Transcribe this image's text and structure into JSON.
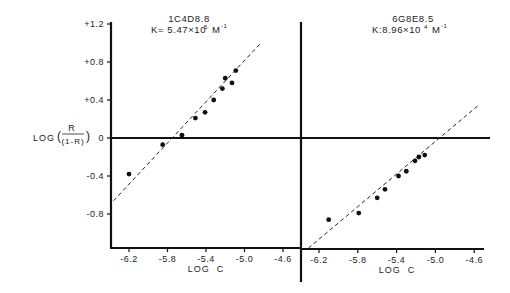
{
  "chart_data": [
    {
      "type": "scatter",
      "title": "1C4D8.8",
      "subtitle": "K= 5.47×10^5 M^-1",
      "k_label": {
        "prefix": "K= 5.47×10",
        "exp": "5",
        "unit": "M",
        "unit_exp": "-1"
      },
      "xlabel": "LOG  C",
      "ylabel": "LOG ( R / (1-R) )",
      "xticks": [
        "-6.2",
        "-5.8",
        "-5.4",
        "-5.0",
        "-4.6"
      ],
      "yticks": [
        "+1.2",
        "+0.8",
        "+0.4",
        "0",
        "-0.4",
        "-0.8"
      ],
      "xlim": [
        -6.4,
        -4.4
      ],
      "ylim": [
        -1.15,
        1.2
      ],
      "grid": false,
      "points": {
        "x": [
          -6.2,
          -5.85,
          -5.65,
          -5.51,
          -5.41,
          -5.32,
          -5.23,
          -5.2,
          -5.13,
          -5.09
        ],
        "y": [
          -0.38,
          -0.07,
          0.03,
          0.21,
          0.27,
          0.4,
          0.52,
          0.63,
          0.58,
          0.71
        ]
      },
      "fit_line": {
        "style": "dashed",
        "x": [
          -6.36,
          -4.83
        ],
        "y": [
          -0.66,
          1.0
        ]
      }
    },
    {
      "type": "scatter",
      "title": "6G8E8.5",
      "subtitle": "K:8.96×10^4 M^-1",
      "k_label": {
        "prefix": "K:8.96×10",
        "exp": "4",
        "unit": "M",
        "unit_exp": "-1"
      },
      "xlabel": "LOG  C",
      "ylabel": "LOG ( R / (1-R) )",
      "xticks": [
        "-6.2",
        "-5.8",
        "-5.4",
        "-5.0",
        "-4.6"
      ],
      "yticks": [
        "+1.2",
        "+0.8",
        "+0.4",
        "0",
        "-0.4",
        "-0.8"
      ],
      "xlim": [
        -6.4,
        -4.4
      ],
      "ylim": [
        -1.15,
        1.2
      ],
      "grid": false,
      "points": {
        "x": [
          -6.1,
          -5.79,
          -5.6,
          -5.52,
          -5.38,
          -5.3,
          -5.21,
          -5.17,
          -5.11
        ],
        "y": [
          -0.86,
          -0.79,
          -0.63,
          -0.54,
          -0.4,
          -0.35,
          -0.24,
          -0.2,
          -0.18
        ]
      },
      "fit_line": {
        "style": "dashed",
        "x": [
          -6.31,
          -4.55
        ],
        "y": [
          -1.16,
          0.35
        ]
      }
    }
  ],
  "labels": {
    "ylabel_prefix": "LOG",
    "ylabel_num": "R",
    "ylabel_den": "(1-R)",
    "xlabel": "LOG  C",
    "yticks": [
      "+1.2",
      "+0.8",
      "+0.4",
      "0",
      "-0.4",
      "-0.8"
    ],
    "xticks": [
      "-6.2",
      "-5.8",
      "-5.4",
      "-5.0",
      "-4.6"
    ],
    "left_title": "1C4D8.8",
    "left_k_prefix": "K= 5.47×10",
    "left_k_exp": "5",
    "right_title": "6G8E8.5",
    "right_k_prefix": "K:8.96×10",
    "right_k_exp": "4",
    "k_unit": "M",
    "k_unit_exp": "-1"
  }
}
